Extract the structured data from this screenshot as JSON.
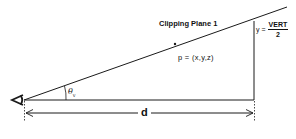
{
  "diagram": {
    "title": "Clipping Plane 1",
    "point_label": "p = (x,y,z)",
    "distance_label": "d",
    "angle_label": {
      "symbol": "θ",
      "subscript": "v"
    },
    "height_label": {
      "prefix": "y =",
      "numerator": "VERT",
      "denominator": "2"
    },
    "eye_icon": "eye-viewpoint-icon",
    "colors": {
      "line": "#1a1a1a",
      "background": "#ffffff"
    }
  }
}
